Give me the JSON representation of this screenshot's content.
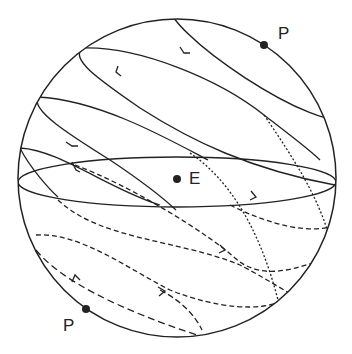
{
  "figure": {
    "type": "celestial sphere diagram",
    "labels": {
      "pole_top": "P",
      "pole_bottom": "P",
      "center": "E"
    },
    "colors": {
      "line": "#222222",
      "background": "#ffffff"
    }
  }
}
